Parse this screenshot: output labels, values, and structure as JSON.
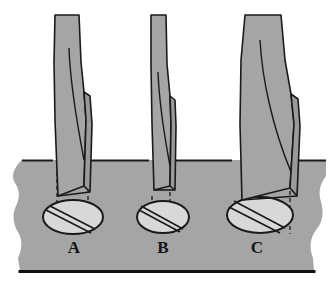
{
  "figure": {
    "type": "technical-illustration",
    "background_color": "#ffffff",
    "workpiece": {
      "name": "workpiece-block",
      "fill_color": "#a5a5a5",
      "stroke_color": "#1a1a1a",
      "top_surface_y": 160,
      "bottom_edge_y": 272,
      "left_edge_x": 8,
      "right_edge_x": 326,
      "edge_style": "torn-irregular"
    },
    "tools": [
      {
        "label": "A",
        "name": "chisel-a",
        "label_x": 74,
        "label_y": 253,
        "fill_color": "#a5a5a5",
        "stroke_color": "#1a1a1a",
        "shaft_top_y": 15,
        "blade_tip_y": 196,
        "width_class": "medium",
        "cut_band_width": "medium",
        "ellipse": {
          "name": "cut-footprint-a",
          "cx": 73,
          "cy": 217,
          "rx": 30,
          "ry": 17,
          "fill_color": "#d2d2d2",
          "stroke_color": "#1a1a1a"
        }
      },
      {
        "label": "B",
        "name": "chisel-b",
        "label_x": 163,
        "label_y": 253,
        "fill_color": "#a5a5a5",
        "stroke_color": "#1a1a1a",
        "shaft_top_y": 15,
        "blade_tip_y": 193,
        "width_class": "narrow",
        "cut_band_width": "narrow",
        "ellipse": {
          "name": "cut-footprint-b",
          "cx": 163,
          "cy": 217,
          "rx": 26,
          "ry": 16,
          "fill_color": "#d2d2d2",
          "stroke_color": "#1a1a1a"
        }
      },
      {
        "label": "C",
        "name": "chisel-c",
        "label_x": 257,
        "label_y": 253,
        "fill_color": "#a5a5a5",
        "stroke_color": "#1a1a1a",
        "shaft_top_y": 15,
        "blade_tip_y": 200,
        "width_class": "wide",
        "cut_band_width": "wide",
        "ellipse": {
          "name": "cut-footprint-c",
          "cx": 260,
          "cy": 215,
          "rx": 33,
          "ry": 18,
          "fill_color": "#d2d2d2",
          "stroke_color": "#1a1a1a"
        }
      }
    ],
    "guide_lines": {
      "name": "projection-dashed-lines",
      "style": "dashed",
      "stroke_color": "#1a1a1a",
      "dash_pattern": "4,3"
    }
  }
}
